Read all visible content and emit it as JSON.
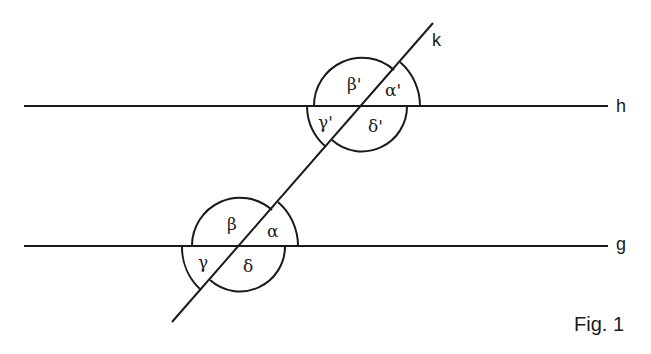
{
  "figure": {
    "caption": "Fig. 1",
    "lines": {
      "h": {
        "label": "h"
      },
      "g": {
        "label": "g"
      },
      "k": {
        "label": "k"
      }
    },
    "angles_upper": {
      "alpha": "α'",
      "beta": "β'",
      "gamma": "γ'",
      "delta": "δ'"
    },
    "angles_lower": {
      "alpha": "α",
      "beta": "β",
      "gamma": "γ",
      "delta": "δ"
    }
  }
}
